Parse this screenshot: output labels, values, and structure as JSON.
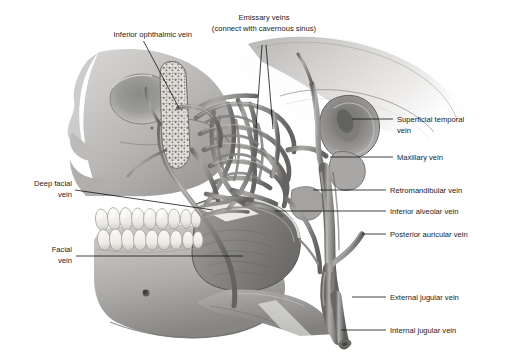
{
  "figure": {
    "background_color": "#ffffff",
    "ink_color": "#1a1a1a",
    "width": 518,
    "height": 356
  },
  "labels": [
    {
      "id": "inferior-ophthalmic-vein",
      "lines": [
        "Inferior ophthalmic vein"
      ],
      "align": "end",
      "text_x": 192,
      "text_y": 37,
      "line_height": 10,
      "leader": "M143.5,41 L179,108"
    },
    {
      "id": "emissary-veins",
      "lines": [
        "Emissary veins",
        "(connect with cavernous sinus)"
      ],
      "align": "middle",
      "text_x": 264,
      "text_y": 20,
      "line_height": 10.5,
      "leader": "M262,45 L256,128 M266,45 L273,129"
    },
    {
      "id": "superficial-temporal-vein",
      "lines": [
        "Superficial temporal",
        "vein"
      ],
      "align": "start",
      "text_x": 397,
      "text_y": 122,
      "line_height": 10.5,
      "leader": "M352,119 L393,119"
    },
    {
      "id": "maxillary-vein",
      "lines": [
        "Maxillary vein"
      ],
      "align": "start",
      "text_x": 397,
      "text_y": 160,
      "line_height": 10.5,
      "leader": "M330,157 L393,157"
    },
    {
      "id": "retromandibular-vein",
      "lines": [
        "Retromandibular vein"
      ],
      "align": "start",
      "text_x": 390,
      "text_y": 193,
      "line_height": 10.5,
      "leader": "M313,190 L386,190"
    },
    {
      "id": "inferior-alveolar-vein",
      "lines": [
        "Inferior alveolar vein"
      ],
      "align": "start",
      "text_x": 390,
      "text_y": 214,
      "line_height": 10.5,
      "leader": "M275,211 L386,211"
    },
    {
      "id": "posterior-auricular-vein",
      "lines": [
        "Posterior auricular vein"
      ],
      "align": "start",
      "text_x": 390,
      "text_y": 237,
      "line_height": 10.5,
      "leader": "M362,234 L386,234"
    },
    {
      "id": "external-jugular-vein",
      "lines": [
        "External jugular vein"
      ],
      "align": "start",
      "text_x": 390,
      "text_y": 300,
      "line_height": 10.5,
      "leader": "M352,297 L386,297"
    },
    {
      "id": "internal-jugular-vein",
      "lines": [
        "Internal jugular vein"
      ],
      "align": "start",
      "text_x": 390,
      "text_y": 333,
      "line_height": 10.5,
      "leader": "M341,330 L386,330"
    },
    {
      "id": "deep-facial-vein",
      "lines": [
        "Deep facial",
        "vein"
      ],
      "align": "end",
      "text_x": 72,
      "text_y": 186,
      "line_height": 10.5,
      "leader": "M75,190 L213,210"
    },
    {
      "id": "facial-vein",
      "lines": [
        "Facial",
        "vein"
      ],
      "align": "end",
      "text_x": 72,
      "text_y": 252,
      "line_height": 10.5,
      "leader": "M76,256 L243,256"
    }
  ],
  "structures": [
    {
      "id": "cranium",
      "name": "cranium"
    },
    {
      "id": "orbit",
      "name": "orbital-cavity"
    },
    {
      "id": "zygomatic-arch",
      "name": "zygomatic-arch"
    },
    {
      "id": "maxilla",
      "name": "maxilla"
    },
    {
      "id": "mandible",
      "name": "mandible"
    },
    {
      "id": "upper-teeth",
      "name": "upper-teeth-row"
    },
    {
      "id": "lower-teeth",
      "name": "lower-teeth-row"
    },
    {
      "id": "external-acoustic-meatus",
      "name": "external-acoustic-meatus"
    },
    {
      "id": "mastoid-process",
      "name": "mastoid-process"
    },
    {
      "id": "pterygoid-plexus",
      "name": "pterygoid-venous-plexus"
    },
    {
      "id": "mental-foramen",
      "name": "mental-foramen"
    }
  ],
  "palette": {
    "bone_light": "#e8e7e5",
    "bone_mid": "#bdbcba",
    "bone_dark": "#8f8e8c",
    "bone_shadow": "#6e6d6c",
    "tooth": "#f3f2ee",
    "tooth_shade": "#cfcdc7",
    "vein": "#9a9896",
    "vein_dark": "#6b6a68",
    "vein_light": "#c2c0bd",
    "outline": "#575654"
  }
}
